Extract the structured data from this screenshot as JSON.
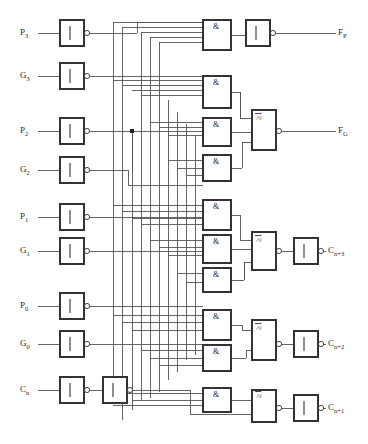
{
  "diagram": {
    "line_color": "#555555",
    "box_color": "#333333",
    "text_color": "#2b2b2b",
    "background": "#ffffff"
  },
  "inputs": [
    {
      "id": "p3",
      "label": "P",
      "sub": "3",
      "x": 22,
      "y": 33,
      "row_y": 33
    },
    {
      "id": "g3",
      "label": "G",
      "sub": "3",
      "x": 22,
      "y": 76,
      "row_y": 76
    },
    {
      "id": "p2",
      "label": "P",
      "sub": "2",
      "x": 22,
      "y": 131,
      "row_y": 131
    },
    {
      "id": "g2",
      "label": "G",
      "sub": "2",
      "x": 22,
      "y": 170,
      "row_y": 170
    },
    {
      "id": "p1",
      "label": "P",
      "sub": "1",
      "x": 22,
      "y": 217,
      "row_y": 217
    },
    {
      "id": "g1",
      "label": "G",
      "sub": "1",
      "x": 22,
      "y": 251,
      "row_y": 251
    },
    {
      "id": "p0",
      "label": "P",
      "sub": "0",
      "x": 22,
      "y": 306,
      "row_y": 306
    },
    {
      "id": "g0",
      "label": "G",
      "sub": "0",
      "x": 22,
      "y": 344,
      "row_y": 344
    },
    {
      "id": "cn",
      "label": "C",
      "sub": "n",
      "x": 22,
      "y": 390,
      "row_y": 390
    }
  ],
  "outputs": [
    {
      "id": "fp",
      "label": "F",
      "sub": "P",
      "x": 340,
      "y": 33
    },
    {
      "id": "fg",
      "label": "F",
      "sub": "G",
      "x": 340,
      "y": 131
    },
    {
      "id": "cn3",
      "label": "C",
      "sub": "n+3",
      "x": 330,
      "y": 251
    },
    {
      "id": "cn2",
      "label": "C",
      "sub": "n+2",
      "x": 330,
      "y": 344
    },
    {
      "id": "cn1",
      "label": "C",
      "sub": "n+1",
      "x": 330,
      "y": 408
    }
  ],
  "gate_symbols": {
    "inverter": "1",
    "and": "&",
    "or": "≥1"
  },
  "input_inverters": [
    {
      "id": "inv-p3",
      "x": 60,
      "y": 20,
      "w": 24,
      "h": 26,
      "symbol": "1"
    },
    {
      "id": "inv-g3",
      "x": 60,
      "y": 63,
      "w": 24,
      "h": 26,
      "symbol": "1"
    },
    {
      "id": "inv-p2",
      "x": 60,
      "y": 118,
      "w": 24,
      "h": 26,
      "symbol": "1"
    },
    {
      "id": "inv-g2",
      "x": 60,
      "y": 157,
      "w": 24,
      "h": 26,
      "symbol": "1"
    },
    {
      "id": "inv-p1",
      "x": 60,
      "y": 204,
      "w": 24,
      "h": 26,
      "symbol": "1"
    },
    {
      "id": "inv-g1",
      "x": 60,
      "y": 238,
      "w": 24,
      "h": 26,
      "symbol": "1"
    },
    {
      "id": "inv-p0",
      "x": 60,
      "y": 293,
      "w": 24,
      "h": 26,
      "symbol": "1"
    },
    {
      "id": "inv-g0",
      "x": 60,
      "y": 331,
      "w": 24,
      "h": 26,
      "symbol": "1"
    },
    {
      "id": "inv-cn-1",
      "x": 60,
      "y": 377,
      "w": 24,
      "h": 26,
      "symbol": "1"
    },
    {
      "id": "inv-cn-2",
      "x": 103,
      "y": 377,
      "w": 24,
      "h": 26,
      "symbol": "1"
    }
  ],
  "and_gates": [
    {
      "id": "and-fp",
      "x": 203,
      "y": 20,
      "w": 28,
      "h": 30,
      "symbol": "&",
      "inputs": 4
    },
    {
      "id": "and-fg-1",
      "x": 203,
      "y": 76,
      "w": 28,
      "h": 32,
      "symbol": "&",
      "inputs": 4
    },
    {
      "id": "and-fg-2",
      "x": 203,
      "y": 118,
      "w": 28,
      "h": 28,
      "symbol": "&",
      "inputs": 3
    },
    {
      "id": "and-fg-3",
      "x": 203,
      "y": 155,
      "w": 28,
      "h": 26,
      "symbol": "&",
      "inputs": 2
    },
    {
      "id": "and-c3-1",
      "x": 203,
      "y": 200,
      "w": 28,
      "h": 30,
      "symbol": "&",
      "inputs": 4
    },
    {
      "id": "and-c3-2",
      "x": 203,
      "y": 235,
      "w": 28,
      "h": 28,
      "symbol": "&",
      "inputs": 3
    },
    {
      "id": "and-c3-3",
      "x": 203,
      "y": 268,
      "w": 28,
      "h": 24,
      "symbol": "&",
      "inputs": 2
    },
    {
      "id": "and-c2-1",
      "x": 203,
      "y": 310,
      "w": 28,
      "h": 30,
      "symbol": "&",
      "inputs": 3
    },
    {
      "id": "and-c2-2",
      "x": 203,
      "y": 345,
      "w": 28,
      "h": 26,
      "symbol": "&",
      "inputs": 2
    },
    {
      "id": "and-c1-1",
      "x": 203,
      "y": 388,
      "w": 28,
      "h": 24,
      "symbol": "&",
      "inputs": 2
    }
  ],
  "or_gates": [
    {
      "id": "or-fg",
      "x": 252,
      "y": 110,
      "w": 24,
      "h": 40,
      "symbol": "≥1"
    },
    {
      "id": "or-c3",
      "x": 252,
      "y": 232,
      "w": 24,
      "h": 38,
      "symbol": "≥1"
    },
    {
      "id": "or-c2",
      "x": 252,
      "y": 320,
      "w": 24,
      "h": 40,
      "symbol": "≥1"
    },
    {
      "id": "or-c1",
      "x": 252,
      "y": 390,
      "w": 24,
      "h": 32,
      "symbol": "≥1"
    }
  ],
  "output_inverters": [
    {
      "id": "inv-fp",
      "x": 246,
      "y": 20,
      "w": 24,
      "h": 26,
      "symbol": "1"
    },
    {
      "id": "inv-cn3",
      "x": 294,
      "y": 238,
      "w": 24,
      "h": 26,
      "symbol": "1"
    },
    {
      "id": "inv-cn2",
      "x": 294,
      "y": 331,
      "w": 24,
      "h": 26,
      "symbol": "1"
    },
    {
      "id": "inv-cn1",
      "x": 294,
      "y": 395,
      "w": 24,
      "h": 26,
      "symbol": "1"
    }
  ],
  "junction_dots": [
    {
      "id": "dot-p2-bus",
      "x": 132,
      "y": 131
    }
  ]
}
